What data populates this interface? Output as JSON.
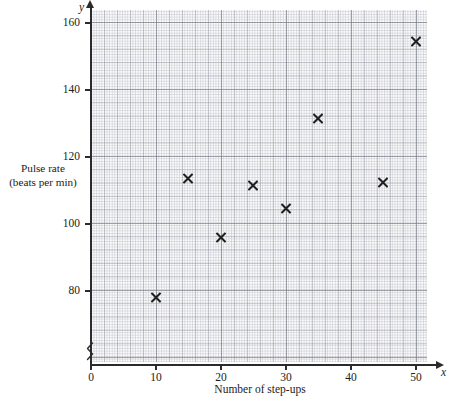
{
  "chart_data": {
    "type": "scatter",
    "title": "",
    "xlabel": "Number of step-ups",
    "ylabel_line1": "Pulse rate",
    "ylabel_line2": "(beats per min)",
    "x_axis_letter": "x",
    "y_axis_letter": "y",
    "xlim": [
      0,
      53
    ],
    "ylim": [
      72,
      164
    ],
    "y_axis_broken": true,
    "grid": true,
    "legend": "none",
    "x_ticks": [
      0,
      10,
      20,
      30,
      40,
      50
    ],
    "y_ticks": [
      80,
      100,
      120,
      140,
      160
    ],
    "points": [
      {
        "x": 10,
        "y": 78
      },
      {
        "x": 15,
        "y": 113.5
      },
      {
        "x": 20,
        "y": 96
      },
      {
        "x": 25,
        "y": 111.5
      },
      {
        "x": 30,
        "y": 104.5
      },
      {
        "x": 35,
        "y": 131.5
      },
      {
        "x": 45,
        "y": 112.5
      },
      {
        "x": 50,
        "y": 154.5
      }
    ],
    "marker": "x-cross",
    "marker_color": "#1f1f1f"
  }
}
